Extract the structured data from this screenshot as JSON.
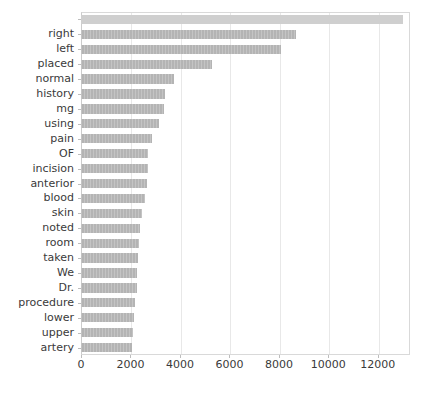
{
  "chart_data": {
    "type": "bar",
    "orientation": "horizontal",
    "title": "",
    "xlabel": "",
    "ylabel": "",
    "xlim": [
      0,
      13300
    ],
    "grid": true,
    "legend": null,
    "bar_color": "#b4b4b4",
    "background_color": "#ffffff",
    "xticks": [
      0,
      2000,
      4000,
      6000,
      8000,
      10000,
      12000
    ],
    "xticklabels": [
      "0",
      "2000",
      "4000",
      "6000",
      "8000",
      "10000",
      "12000"
    ],
    "categories": [
      "",
      "right",
      "left",
      "placed",
      "normal",
      "history",
      "mg",
      "using",
      "pain",
      "OF",
      "incision",
      "anterior",
      "blood",
      "skin",
      "noted",
      "room",
      "taken",
      "We",
      "Dr.",
      "procedure",
      "lower",
      "upper",
      "artery"
    ],
    "values": [
      13000,
      8700,
      8100,
      5300,
      3750,
      3400,
      3350,
      3150,
      2850,
      2720,
      2700,
      2650,
      2600,
      2450,
      2400,
      2350,
      2300,
      2270,
      2250,
      2200,
      2150,
      2110,
      2080
    ]
  },
  "chart": {
    "axis": {
      "x_axis_name": "value-axis",
      "y_axis_name": "category-axis"
    }
  }
}
